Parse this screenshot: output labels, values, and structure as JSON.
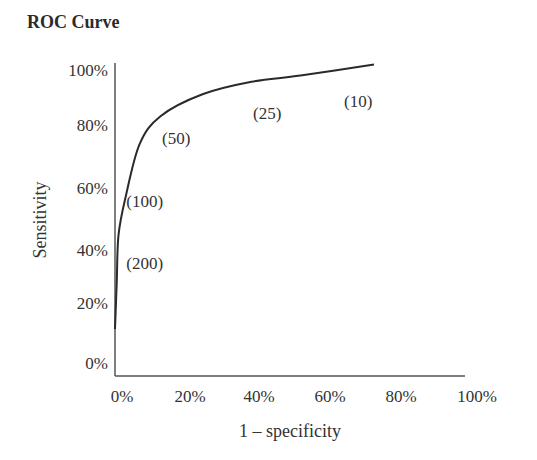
{
  "chart_data": {
    "type": "line",
    "title": "ROC Curve",
    "xlabel": "1 – specificity",
    "ylabel": "Sensitivity",
    "xlim": [
      0,
      100
    ],
    "ylim": [
      0,
      100
    ],
    "grid": false,
    "x_ticks": [
      "0%",
      "20%",
      "40%",
      "60%",
      "80%",
      "100%"
    ],
    "y_ticks": [
      "0%",
      "20%",
      "40%",
      "60%",
      "80%",
      "100%"
    ],
    "series": [
      {
        "name": "ROC",
        "x": [
          0,
          0.5,
          1,
          3,
          7,
          13,
          25,
          39,
          53,
          74
        ],
        "y": [
          15,
          30,
          45,
          57,
          74,
          83,
          90,
          94,
          96,
          99.5
        ]
      }
    ],
    "annotations": [
      {
        "text": "(200)",
        "x": 8.5,
        "y": 36
      },
      {
        "text": "(100)",
        "x": 8.5,
        "y": 56
      },
      {
        "text": "(50)",
        "x": 17.5,
        "y": 76
      },
      {
        "text": "(25)",
        "x": 43.5,
        "y": 84
      },
      {
        "text": "(10)",
        "x": 69.5,
        "y": 88
      }
    ]
  }
}
